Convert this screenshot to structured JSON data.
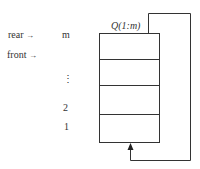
{
  "diagram": {
    "title": "Q(1:m)",
    "pointers": [
      {
        "label": "rear",
        "arrow": "→"
      },
      {
        "label": "front",
        "arrow": "→"
      }
    ],
    "indices": {
      "top": "m",
      "ellipsis": "⋮",
      "second": "2",
      "first": "1"
    },
    "colors": {
      "line": "#333333",
      "background": "#ffffff"
    }
  }
}
